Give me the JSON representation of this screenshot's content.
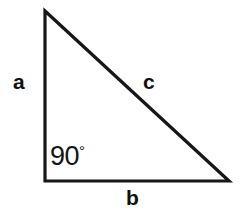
{
  "figure": {
    "background_color": "#ffffff",
    "stroke_color": "#171717",
    "stroke_width": 3.2
  },
  "labels": {
    "side_a": "a",
    "side_b": "b",
    "side_c": "c",
    "angle_value": "90",
    "angle_degree_symbol": "°"
  },
  "geometry": {
    "apex": {
      "x": 45,
      "y": 11
    },
    "bottom_left": {
      "x": 45,
      "y": 181
    },
    "bottom_right": {
      "x": 229,
      "y": 181
    },
    "vertical_leg_label_pos": {
      "x": 21,
      "y": 82
    },
    "horizontal_leg_label_pos": {
      "x": 133,
      "y": 198
    },
    "hypotenuse_label_pos": {
      "x": 150,
      "y": 82
    },
    "angle_label_pos": {
      "x": 66,
      "y": 157
    }
  }
}
